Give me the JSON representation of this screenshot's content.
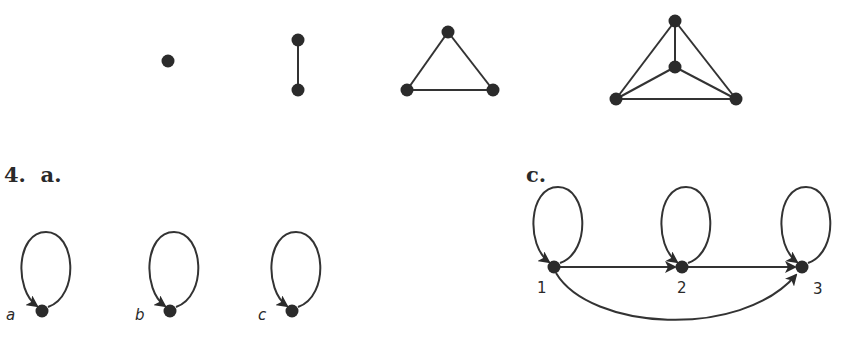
{
  "colors": {
    "ink": "#2b2b2b",
    "edge": "#333333",
    "background": "#ffffff"
  },
  "top_row": {
    "graphs": [
      {
        "name": "K1",
        "vertices": [
          [
            168,
            61
          ]
        ],
        "edges": []
      },
      {
        "name": "K2",
        "vertices": [
          [
            298,
            40
          ],
          [
            298,
            90
          ]
        ],
        "edges": [
          [
            0,
            1
          ]
        ]
      },
      {
        "name": "K3",
        "vertices": [
          [
            448,
            32
          ],
          [
            407,
            90
          ],
          [
            493,
            90
          ]
        ],
        "edges": [
          [
            0,
            1
          ],
          [
            0,
            2
          ],
          [
            1,
            2
          ]
        ]
      },
      {
        "name": "K4",
        "vertices": [
          [
            675,
            21
          ],
          [
            675,
            67
          ],
          [
            616,
            99
          ],
          [
            736,
            99
          ]
        ],
        "edges": [
          [
            0,
            1
          ],
          [
            0,
            2
          ],
          [
            0,
            3
          ],
          [
            1,
            2
          ],
          [
            1,
            3
          ],
          [
            2,
            3
          ]
        ]
      }
    ]
  },
  "section_4a": {
    "heading": "4.  a.",
    "vertices": [
      {
        "label": "a",
        "x": 42,
        "y": 311
      },
      {
        "label": "b",
        "x": 170,
        "y": 311
      },
      {
        "label": "c",
        "x": 292,
        "y": 311
      }
    ],
    "edges": [
      {
        "from": "a",
        "to": "a",
        "type": "loop"
      },
      {
        "from": "b",
        "to": "b",
        "type": "loop"
      },
      {
        "from": "c",
        "to": "c",
        "type": "loop"
      }
    ]
  },
  "section_c": {
    "heading": "c.",
    "vertices": [
      {
        "label": "1",
        "x": 554,
        "y": 267
      },
      {
        "label": "2",
        "x": 682,
        "y": 267
      },
      {
        "label": "3",
        "x": 802,
        "y": 267
      }
    ],
    "edges": [
      {
        "from": "1",
        "to": "1",
        "type": "loop"
      },
      {
        "from": "2",
        "to": "2",
        "type": "loop"
      },
      {
        "from": "3",
        "to": "3",
        "type": "loop"
      },
      {
        "from": "1",
        "to": "2",
        "type": "straight"
      },
      {
        "from": "2",
        "to": "3",
        "type": "straight"
      },
      {
        "from": "1",
        "to": "3",
        "type": "curved-below"
      }
    ]
  }
}
